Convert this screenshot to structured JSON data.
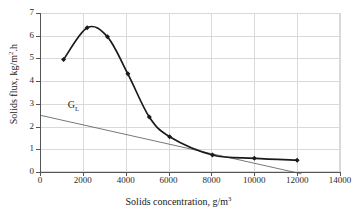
{
  "chart_data": {
    "type": "line",
    "title": "",
    "xlabel": "Solids concentration, g/m",
    "xlabel_sup": "3",
    "ylabel": "Solids flux, kg/m",
    "ylabel_sup": "2",
    "ylabel_tail": ".h",
    "xlim": [
      0,
      14000
    ],
    "ylim": [
      0,
      7
    ],
    "grid": true,
    "legend": "none",
    "xticks": [
      "0",
      "2000",
      "4000",
      "6000",
      "8000",
      "10000",
      "12000",
      "14000"
    ],
    "xtick_values": [
      0,
      2000,
      4000,
      6000,
      8000,
      10000,
      12000,
      14000
    ],
    "yticks": [
      "0",
      "1",
      "2",
      "3",
      "4",
      "5",
      "6",
      "7"
    ],
    "ytick_values": [
      0,
      1,
      2,
      3,
      4,
      5,
      6,
      7
    ],
    "series": [
      {
        "name": "batch-flux-curve",
        "style": "smooth-line-with-markers",
        "marker": "filled-diamond",
        "color": "#1a1a1a",
        "x": [
          1100,
          2200,
          3150,
          4100,
          5100,
          6050,
          8050,
          10000,
          12000
        ],
        "values": [
          4.95,
          6.35,
          5.95,
          4.32,
          2.42,
          1.55,
          0.75,
          0.6,
          0.52
        ]
      },
      {
        "name": "GL",
        "style": "straight-line",
        "color": "#555555",
        "x": [
          0,
          12200
        ],
        "values": [
          2.5,
          -0.08
        ]
      }
    ],
    "annotations": [
      {
        "name": "GL",
        "text": "G",
        "subscript": "L",
        "x": 1300,
        "y": 2.95
      }
    ]
  }
}
